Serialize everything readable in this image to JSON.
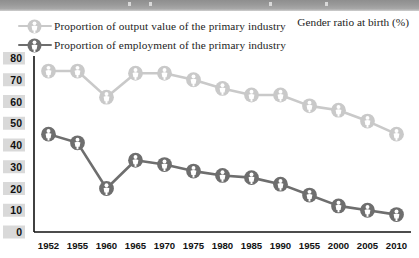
{
  "chart_data": {
    "type": "line",
    "title": "Gender ratio at birth (%)",
    "xlabel": "",
    "ylabel": "",
    "ylim": [
      0,
      80
    ],
    "ytick_values": [
      0,
      10,
      20,
      30,
      40,
      50,
      60,
      70,
      80
    ],
    "grid": false,
    "legend_position": "top-left",
    "categories": [
      "1952",
      "1955",
      "1960",
      "1965",
      "1970",
      "1975",
      "1980",
      "1985",
      "1990",
      "1955",
      "2000",
      "2005",
      "2010"
    ],
    "series": [
      {
        "name": "Proportion of output value of the primary industry",
        "color": "#c9c9c9",
        "marker": "person-circle-icon",
        "values": [
          74,
          74,
          62,
          73,
          73,
          70,
          66,
          63,
          63,
          58,
          56,
          51,
          45
        ]
      },
      {
        "name": "Proportion of employment of the primary industry",
        "color": "#6e6e6e",
        "marker": "person-circle-icon",
        "values": [
          45,
          41,
          20,
          33,
          31,
          28,
          26,
          25,
          22,
          17,
          12,
          10,
          8
        ]
      }
    ]
  },
  "legend": {
    "items": [
      {
        "label": "Proportion of output value of the primary industry",
        "marker": "person-circle-icon"
      },
      {
        "label": "Proportion of employment of the primary industry",
        "marker": "person-circle-icon"
      }
    ]
  },
  "colors": {
    "series_light": "#c9c9c9",
    "series_dark": "#6e6e6e",
    "axis": "#111111",
    "tick_box": "#d9d9d9",
    "background": "#ffffff"
  }
}
